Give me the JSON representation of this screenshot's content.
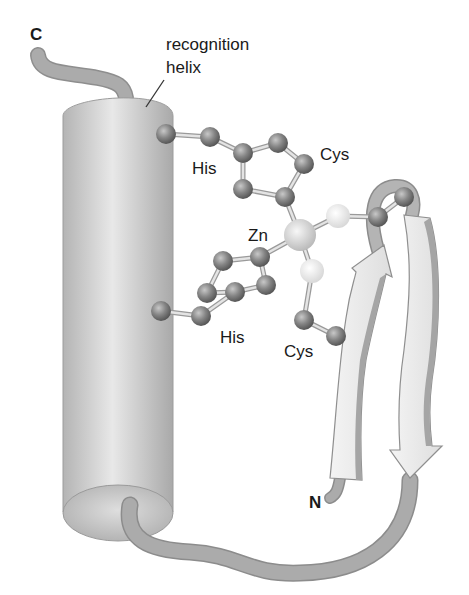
{
  "figure": {
    "labels": {
      "c_terminus": "C",
      "n_terminus": "N",
      "recognition_helix_line1": "recognition",
      "recognition_helix_line2": "helix",
      "zinc": "Zn",
      "his_upper": "His",
      "his_lower": "His",
      "cys_upper": "Cys",
      "cys_lower": "Cys"
    },
    "colors": {
      "background": "#ffffff",
      "helix_body": "#c4c4c4",
      "helix_highlight": "#e6e6e6",
      "backbone_tube": "#a8a8a8",
      "beta_strand_face": "#ebebeb",
      "beta_strand_edge": "#9a9a9a",
      "atom_carbon": "#808080",
      "atom_sulfur": "#eeeeee",
      "atom_zinc": "#dadada",
      "bond": "#d8d8d8",
      "text": "#1a1a1a"
    }
  }
}
